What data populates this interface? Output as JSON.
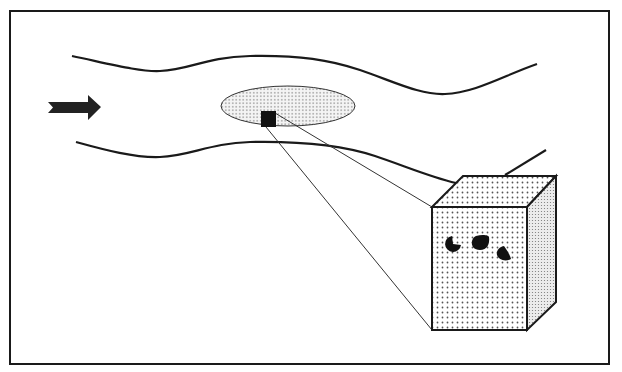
{
  "diagram": {
    "colors": {
      "background": "#ffffff",
      "stroke": "#1a1a1a",
      "fill_dots": "#555555",
      "ellipse_fill": "#f2f2f2",
      "cube_side_fill": "#e8e8e8",
      "solid": "#111111"
    },
    "elements": {
      "frame": {
        "label": "Diagram frame"
      },
      "flow_arrow": {
        "label": "Flow direction arrow",
        "direction": "right"
      },
      "channel_upper_wall": {
        "label": "Upper channel boundary"
      },
      "channel_lower_wall": {
        "label": "Lower channel boundary"
      },
      "region_ellipse": {
        "label": "Dotted region (dispersed zone)"
      },
      "sample_square": {
        "label": "Selected sample element"
      },
      "zoom_lines": {
        "label": "Magnification projection lines"
      },
      "volume_cube": {
        "label": "Magnified volume element"
      },
      "particles": [
        {
          "label": "Particle 1",
          "shape": "notched-circle"
        },
        {
          "label": "Particle 2",
          "shape": "rounded-blob"
        },
        {
          "label": "Particle 3",
          "shape": "teardrop"
        }
      ]
    }
  }
}
